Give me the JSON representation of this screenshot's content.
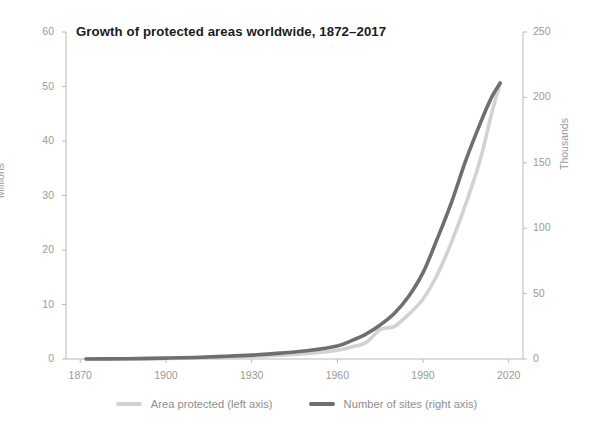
{
  "chart_data": {
    "type": "line",
    "title": "Growth of protected areas worldwide, 1872–2017",
    "xlabel": "",
    "ylabel": "Millions",
    "y2label": "Thousands",
    "xlim": [
      1865,
      2025
    ],
    "ylim": [
      0,
      60
    ],
    "y2lim": [
      0,
      250
    ],
    "grid": false,
    "legend_position": "bottom-center",
    "xticks": [
      1870,
      1900,
      1930,
      1960,
      1990,
      2020
    ],
    "yticks": [
      0,
      10,
      20,
      30,
      40,
      50,
      60
    ],
    "y2ticks": [
      0,
      50,
      100,
      150,
      200,
      250
    ],
    "x": [
      1872,
      1880,
      1890,
      1900,
      1910,
      1920,
      1930,
      1940,
      1950,
      1960,
      1965,
      1970,
      1975,
      1980,
      1985,
      1990,
      1995,
      2000,
      2005,
      2010,
      2014,
      2017
    ],
    "series": [
      {
        "name": "Area protected (left axis)",
        "axis": "left",
        "units": "millions of km²",
        "color": "#d2d2d2",
        "values": [
          0.0,
          0.0,
          0.05,
          0.1,
          0.2,
          0.3,
          0.5,
          0.7,
          1.0,
          1.6,
          2.2,
          3.0,
          5.4,
          6.0,
          8.2,
          11.0,
          15.5,
          21.5,
          28.5,
          36.5,
          45.0,
          50.5
        ]
      },
      {
        "name": "Number of sites (right axis)",
        "axis": "right",
        "units": "thousands of sites",
        "color": "#6f6f6f",
        "values": [
          0.0,
          0.1,
          0.3,
          0.7,
          1.2,
          2.0,
          3.0,
          4.5,
          6.5,
          10.0,
          14.0,
          19.0,
          26.0,
          35.0,
          48.0,
          66.0,
          92.0,
          120.0,
          152.0,
          180.0,
          200.0,
          211.0
        ]
      }
    ],
    "legend": [
      {
        "label": "Area protected (left axis)",
        "color": "#d2d2d2"
      },
      {
        "label": "Number of sites (right axis)",
        "color": "#6f6f6f"
      }
    ],
    "axis_color": "#b9b9b9"
  }
}
